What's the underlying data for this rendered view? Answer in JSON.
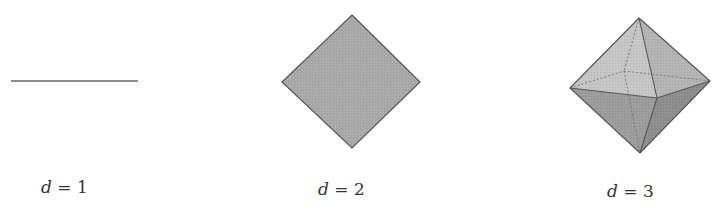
{
  "figure": {
    "colors": {
      "stroke": "#555555",
      "fill_2d": "#a9a9a9",
      "fill_3d_top_left": "#c4c4c4",
      "fill_3d_top_right": "#b3b3b3",
      "fill_3d_bottom_left": "#9a9a9a",
      "fill_3d_bottom_right": "#8c8c8c",
      "hidden_edge": "#777777"
    },
    "panels": [
      {
        "shape": "line segment",
        "label_var": "d",
        "label_eq": " = ",
        "label_val": "1"
      },
      {
        "shape": "filled square (diamond)",
        "label_var": "d",
        "label_eq": " = ",
        "label_val": "2"
      },
      {
        "shape": "octahedron",
        "label_var": "d",
        "label_eq": " = ",
        "label_val": "3"
      }
    ]
  }
}
